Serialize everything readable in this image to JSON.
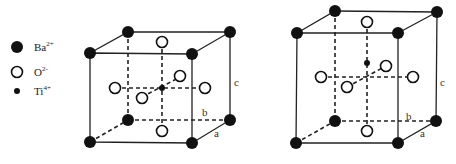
{
  "legend": {
    "items": [
      {
        "id": "ba",
        "symbol": "filled-large-circle",
        "label": "Ba",
        "charge": "2+"
      },
      {
        "id": "o",
        "symbol": "open-circle",
        "label": "O",
        "charge": "2-"
      },
      {
        "id": "ti",
        "symbol": "filled-small-circle",
        "label": "Ti",
        "charge": "4+"
      }
    ]
  },
  "cells": [
    {
      "name": "cubic-cell",
      "axis_labels": {
        "a": "a",
        "b": "b",
        "c": "c"
      },
      "ti_position": "center"
    },
    {
      "name": "tetragonal-cell",
      "axis_labels": {
        "a": "a",
        "b": "b",
        "c": "c"
      },
      "ti_position": "displaced-up"
    }
  ],
  "colors": {
    "ink": "#111111",
    "background": "#ffffff"
  }
}
